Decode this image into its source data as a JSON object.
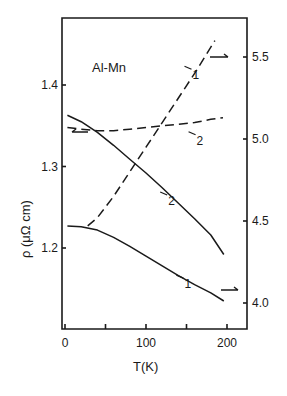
{
  "chart_data": {
    "type": "line",
    "title": "Al-Mn",
    "annotation": "Al-Mn",
    "xlabel": "T(K)",
    "ylabel": "ρ (μΩ cm)",
    "ylabel_right": "",
    "xlim": [
      0,
      225
    ],
    "ylim": [
      1.1,
      1.48
    ],
    "ylim_right": [
      3.85,
      5.72
    ],
    "x_ticks": [
      0,
      100,
      200
    ],
    "x_minor_ticks": [
      50,
      150
    ],
    "x_tick_labels": [
      "0",
      "100",
      "200"
    ],
    "y_ticks": [
      1.2,
      1.3,
      1.4
    ],
    "y_tick_labels": [
      "1.2",
      "1.3",
      "1.4"
    ],
    "y_right_ticks": [
      4.0,
      4.5,
      5.0,
      5.5
    ],
    "y_right_tick_labels": [
      "4.0",
      "4.5",
      "5.0",
      "5.5"
    ],
    "grid": false,
    "legend": "none (curves labeled 1 and 2 inline; arrows indicate axis)",
    "series": [
      {
        "name": "1 (solid)",
        "style": "solid",
        "axis": "left",
        "x": [
          3,
          20,
          40,
          60,
          80,
          100,
          120,
          140,
          160,
          180,
          196
        ],
        "values": [
          1.227,
          1.226,
          1.222,
          1.213,
          1.202,
          1.19,
          1.178,
          1.166,
          1.155,
          1.145,
          1.135
        ]
      },
      {
        "name": "2 (solid)",
        "style": "solid",
        "axis": "left",
        "x": [
          3,
          20,
          40,
          60,
          80,
          100,
          120,
          140,
          160,
          180,
          196
        ],
        "values": [
          1.363,
          1.355,
          1.342,
          1.326,
          1.309,
          1.292,
          1.274,
          1.255,
          1.236,
          1.216,
          1.192
        ]
      },
      {
        "name": "1 (dashed)",
        "style": "dashed",
        "axis": "right",
        "x": [
          28,
          40,
          60,
          80,
          100,
          120,
          140,
          160,
          185
        ],
        "values": [
          4.47,
          4.52,
          4.65,
          4.8,
          4.95,
          5.1,
          5.25,
          5.4,
          5.6
        ]
      },
      {
        "name": "2 (dashed)",
        "style": "dashed",
        "axis": "right",
        "x": [
          3,
          20,
          40,
          60,
          80,
          100,
          120,
          140,
          160,
          180,
          195
        ],
        "values": [
          5.07,
          5.06,
          5.05,
          5.05,
          5.06,
          5.07,
          5.08,
          5.09,
          5.1,
          5.12,
          5.13
        ]
      }
    ],
    "curve_labels": [
      {
        "text": "1",
        "near": "dashed 1",
        "x": 150,
        "y_right": 5.45
      },
      {
        "text": "2",
        "near": "dashed 2",
        "x": 155,
        "y_right": 5.05
      },
      {
        "text": "2",
        "near": "solid 2",
        "x": 120,
        "y": 1.27
      },
      {
        "text": "1",
        "near": "solid 1",
        "x": 140,
        "y": 1.168
      }
    ]
  },
  "labels": {
    "annotation": "Al-Mn",
    "xlabel": "T(K)",
    "ylabel": "ρ (μΩ cm)",
    "curve_1": "1",
    "curve_2": "2"
  }
}
